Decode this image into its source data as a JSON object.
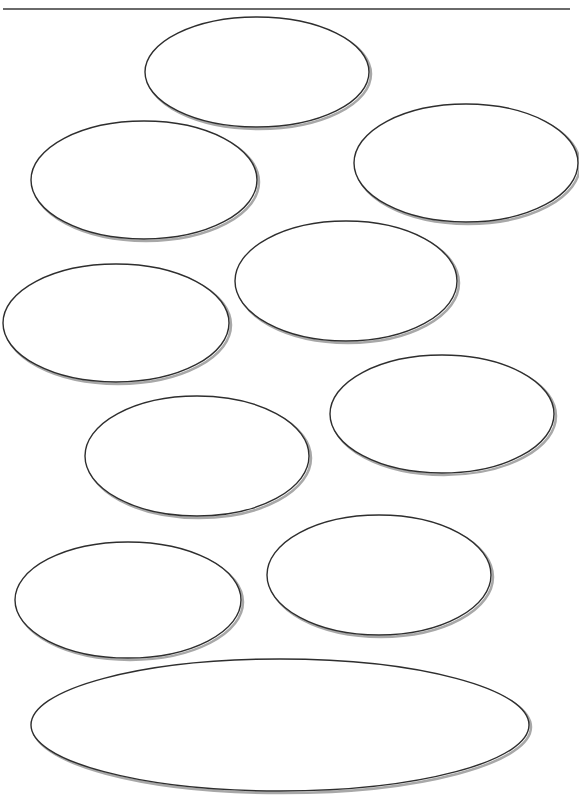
{
  "worksheet": {
    "title_fragment": "p",
    "oval_count": 10,
    "colors": {
      "background": "#ffffff",
      "outline": "#2e2e2e",
      "shadow": "#a8a8a8",
      "rule": "#6a6a6a"
    },
    "ovals": [
      {
        "id": 1,
        "cx": 257,
        "cy": 72,
        "rx": 112,
        "ry": 55,
        "text": ""
      },
      {
        "id": 2,
        "cx": 144,
        "cy": 180,
        "rx": 113,
        "ry": 59,
        "text": ""
      },
      {
        "id": 3,
        "cx": 466,
        "cy": 163,
        "rx": 112,
        "ry": 59,
        "text": ""
      },
      {
        "id": 4,
        "cx": 346,
        "cy": 281,
        "rx": 111,
        "ry": 60,
        "text": ""
      },
      {
        "id": 5,
        "cx": 116,
        "cy": 323,
        "rx": 113,
        "ry": 59,
        "text": ""
      },
      {
        "id": 6,
        "cx": 442,
        "cy": 414,
        "rx": 112,
        "ry": 59,
        "text": ""
      },
      {
        "id": 7,
        "cx": 197,
        "cy": 456,
        "rx": 112,
        "ry": 60,
        "text": ""
      },
      {
        "id": 8,
        "cx": 379,
        "cy": 575,
        "rx": 112,
        "ry": 60,
        "text": ""
      },
      {
        "id": 9,
        "cx": 128,
        "cy": 600,
        "rx": 113,
        "ry": 58,
        "text": ""
      },
      {
        "id": 10,
        "cx": 280,
        "cy": 725,
        "rx": 249,
        "ry": 66,
        "text": ""
      }
    ]
  }
}
